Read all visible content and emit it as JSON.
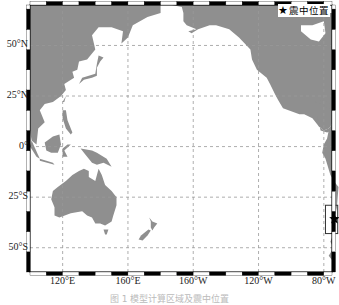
{
  "map": {
    "projection": "equirectangular",
    "lon_range_deg_east": [
      100,
      285
    ],
    "lat_range_deg": [
      -62,
      70
    ],
    "lat_ticks": [
      {
        "value": 50,
        "label": "50°N"
      },
      {
        "value": 25,
        "label": "25°N"
      },
      {
        "value": 0,
        "label": "0°"
      },
      {
        "value": -25,
        "label": "25°S"
      },
      {
        "value": -50,
        "label": "50°S"
      }
    ],
    "lon_ticks": [
      {
        "value": 120,
        "label": "120°E"
      },
      {
        "value": 160,
        "label": "160°E"
      },
      {
        "value": 200,
        "label": "160°W"
      },
      {
        "value": 240,
        "label": "120°W"
      },
      {
        "value": 280,
        "label": "80°W"
      }
    ],
    "gridlines": "dashed",
    "land_color": "#8f8f8f",
    "ocean_color": "#ffffff",
    "epicenter": {
      "lon": 286.5,
      "lat": -35.8,
      "marker": "star-icon"
    },
    "highlight_box": {
      "lon": [
        281,
        288.5
      ],
      "lat": [
        -29,
        -43
      ]
    }
  },
  "legend": {
    "icon": "★",
    "label": "震中位置"
  },
  "caption": "图 1   模型计算区域及震中位置"
}
